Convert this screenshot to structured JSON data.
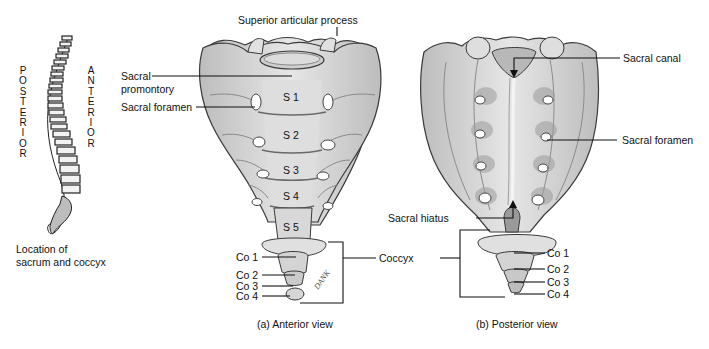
{
  "spine_panel": {
    "posterior_letters": [
      "P",
      "O",
      "S",
      "T",
      "E",
      "R",
      "I",
      "O",
      "R"
    ],
    "anterior_letters": [
      "A",
      "N",
      "T",
      "E",
      "R",
      "I",
      "O",
      "R"
    ],
    "caption_line1": "Location of",
    "caption_line2": "sacrum and coccyx"
  },
  "anterior_view": {
    "caption": "(a) Anterior view",
    "labels": {
      "superior_articular_process": "Superior articular process",
      "sacral_promontory_line1": "Sacral",
      "sacral_promontory_line2": "promontory",
      "sacral_foramen": "Sacral foramen",
      "coccyx": "Coccyx"
    },
    "segments": [
      "S 1",
      "S 2",
      "S 3",
      "S 4",
      "S 5"
    ],
    "coccygeal": [
      "Co 1",
      "Co 2",
      "Co 3",
      "Co 4"
    ],
    "signature": "DANK"
  },
  "posterior_view": {
    "caption": "(b) Posterior view",
    "labels": {
      "sacral_canal": "Sacral canal",
      "sacral_foramen": "Sacral foramen",
      "sacral_hiatus": "Sacral hiatus"
    },
    "coccygeal": [
      "Co 1",
      "Co 2",
      "Co 3",
      "Co 4"
    ]
  },
  "colors": {
    "bone_fill": "#d9d9d9",
    "bone_shadow": "#a8a8a8",
    "bone_dark": "#7a7a7a",
    "outline": "#3a3a3a",
    "leader": "#111111"
  }
}
